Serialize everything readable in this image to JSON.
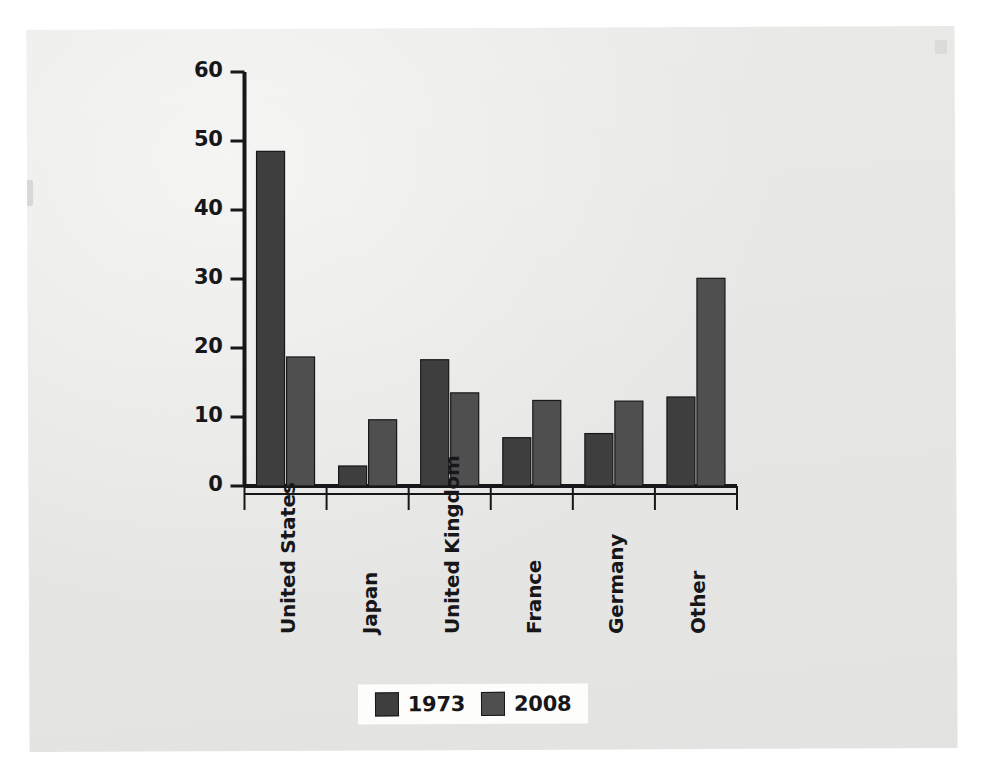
{
  "chart_data": {
    "type": "bar",
    "title": "",
    "subtitle": "",
    "xlabel": "",
    "ylabel": "",
    "categories": [
      "United States",
      "Japan",
      "United Kingdom",
      "France",
      "Germany",
      "Other"
    ],
    "series": [
      {
        "name": "1973",
        "color": "#3e3e3e",
        "values": [
          48.5,
          2.9,
          18.3,
          7.0,
          7.6,
          12.9
        ]
      },
      {
        "name": "2008",
        "color": "#4f4f4f",
        "values": [
          18.7,
          9.6,
          13.5,
          12.4,
          12.3,
          30.1
        ]
      }
    ],
    "ylim": [
      0,
      60
    ],
    "yticks": [
      0,
      10,
      20,
      30,
      40,
      50,
      60
    ],
    "ytick_labels": [
      "0",
      "10",
      "20",
      "30",
      "40",
      "50",
      "60"
    ],
    "grid": false,
    "legend_position": "bottom",
    "axis_color": "#17171a"
  },
  "legend": {
    "entries": [
      {
        "label": "1973",
        "swatch_name": "legend-swatch-1973"
      },
      {
        "label": "2008",
        "swatch_name": "legend-swatch-2008"
      }
    ]
  },
  "colors": {
    "page_background": "#ececea",
    "canvas": "#ffffff",
    "series_1973": "#3e3e3e",
    "series_2008": "#4f4f4f",
    "axis": "#17171a",
    "legend_background": "#fdfdfc"
  }
}
